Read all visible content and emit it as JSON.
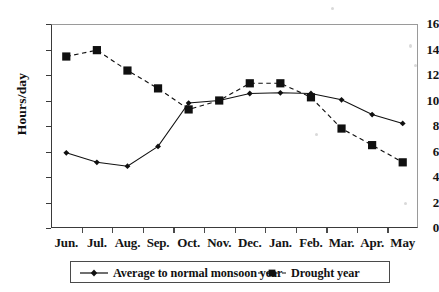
{
  "chart_data": {
    "type": "line",
    "title": "",
    "xlabel": "",
    "ylabel": "Hours/day",
    "categories": [
      "Jun.",
      "Jul.",
      "Aug.",
      "Sep.",
      "Oct.",
      "Nov.",
      "Dec.",
      "Jan.",
      "Feb.",
      "Mar.",
      "Apr.",
      "May"
    ],
    "ylim": [
      0,
      16
    ],
    "ytick_values": [
      16,
      14,
      12,
      10,
      8,
      6,
      4,
      2,
      0
    ],
    "ytick_labels": [
      "16",
      "14",
      "12",
      "10",
      "8",
      "6",
      "4",
      "2",
      "0"
    ],
    "grid": true,
    "legend_position": "bottom",
    "series": [
      {
        "name": "Average to normal monsoon year",
        "marker": "diamond",
        "linestyle": "solid",
        "color": "#101010",
        "values": [
          5.9,
          5.15,
          4.85,
          6.4,
          9.8,
          10.0,
          10.55,
          10.6,
          10.55,
          10.05,
          8.9,
          8.2
        ]
      },
      {
        "name": "Drought year",
        "marker": "square",
        "linestyle": "dashed",
        "color": "#101010",
        "values": [
          13.45,
          13.95,
          12.35,
          10.95,
          9.3,
          10.0,
          11.35,
          11.35,
          10.25,
          7.8,
          6.5,
          5.15
        ]
      }
    ]
  },
  "axes": {
    "gridline_color": "#a8a8a8",
    "axis_color": "#3a3a3a"
  },
  "legend": {
    "entries": [
      {
        "label": "Average to normal monsoon year"
      },
      {
        "label": "Drought year"
      }
    ]
  }
}
